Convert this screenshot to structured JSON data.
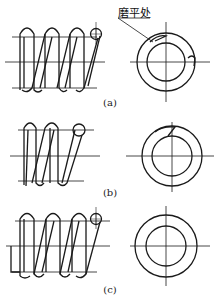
{
  "figure": {
    "annotation": "磨平处",
    "panels": [
      {
        "id": "a",
        "caption": "(a)"
      },
      {
        "id": "b",
        "caption": "(b)"
      },
      {
        "id": "c",
        "caption": "(c)"
      }
    ]
  },
  "colors": {
    "line": "#1a1a1a",
    "background": "#ffffff"
  }
}
